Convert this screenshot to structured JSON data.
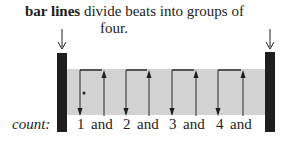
{
  "caption": {
    "term": "bar lines",
    "line1_rest": " divide beats into groups of",
    "line2": "four."
  },
  "count": {
    "label": "count:",
    "items": [
      {
        "text": "1",
        "x": 0
      },
      {
        "text": "and",
        "x": 14
      },
      {
        "text": "2",
        "x": 46
      },
      {
        "text": "and",
        "x": 60
      },
      {
        "text": "3",
        "x": 92
      },
      {
        "text": "and",
        "x": 106
      },
      {
        "text": "4",
        "x": 139
      },
      {
        "text": "and",
        "x": 153
      }
    ]
  },
  "diagram": {
    "measure_fill": "#d3d3d3",
    "bar_line_color": "#1e1e1e",
    "beats": [
      {
        "beat": 1,
        "down_x": 80,
        "up_x": 104
      },
      {
        "beat": 2,
        "down_x": 126,
        "up_x": 149
      },
      {
        "beat": 3,
        "down_x": 172,
        "up_x": 196
      },
      {
        "beat": 4,
        "down_x": 218,
        "up_x": 243
      }
    ],
    "bar_lines": [
      {
        "name": "left",
        "x": 57,
        "width": 10
      },
      {
        "name": "right",
        "x": 265,
        "width": 10
      }
    ]
  }
}
